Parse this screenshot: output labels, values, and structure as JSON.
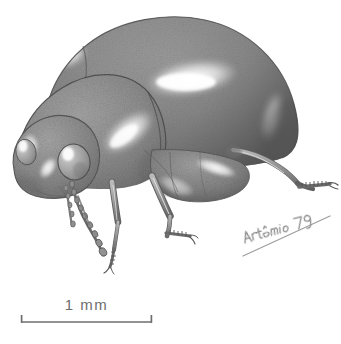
{
  "figure": {
    "type": "scientific-illustration",
    "view": "lateral-oblique",
    "medium": "graphite-stipple-drawing",
    "background_color": "#ffffff",
    "body_color": "#8a8a8a",
    "body_shadow_color": "#5e5e5e",
    "body_highlight_color": "#fdfdfd",
    "outline_color": "#4a4a4a"
  },
  "scale_bar": {
    "label": "1 mm",
    "length_px": 131,
    "left_px": 21,
    "right_px": 152,
    "baseline_y_px": 322,
    "tick_height_px": 7,
    "color": "#6e6e6e"
  },
  "signature": {
    "text": "Artêmio 79",
    "artist": "Artêmio",
    "year": "79",
    "has_underline_stroke": true,
    "color": "#7a7a7a",
    "x_px": 243,
    "y_px": 236
  },
  "anatomy": {
    "parts": [
      {
        "name": "elytra",
        "label": "elytra"
      },
      {
        "name": "pronotum",
        "label": "pronotum"
      },
      {
        "name": "head",
        "label": "head"
      },
      {
        "name": "compound-eye",
        "label": "compound eye"
      },
      {
        "name": "antenna-left",
        "label": "left antenna"
      },
      {
        "name": "antenna-right",
        "label": "right antenna"
      },
      {
        "name": "foreleg",
        "label": "foreleg"
      },
      {
        "name": "midleg",
        "label": "midleg"
      },
      {
        "name": "hindleg",
        "label": "hindleg"
      },
      {
        "name": "ventral-surface",
        "label": "ventral surface"
      }
    ],
    "highlight_count": 6
  }
}
